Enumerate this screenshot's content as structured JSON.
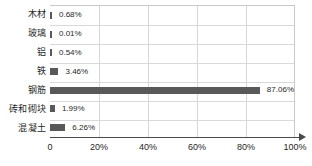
{
  "chart_data": {
    "type": "bar",
    "orientation": "horizontal",
    "title": "",
    "subtitle": "",
    "xlabel": "",
    "ylabel": "",
    "xlim": [
      0,
      100
    ],
    "grid": true,
    "legend": false,
    "legend_position": "none",
    "categories": [
      "木材",
      "玻璃",
      "铝",
      "铁",
      "钢筋",
      "砖和砌块",
      "混凝土"
    ],
    "values": [
      0.68,
      0.01,
      0.54,
      3.46,
      87.06,
      1.99,
      6.26
    ],
    "data_labels": [
      "0.68%",
      "0.01%",
      "0.54%",
      "3.46%",
      "87.06%",
      "1.99%",
      "6.26%"
    ],
    "xticks": [
      0,
      20,
      40,
      60,
      80,
      100
    ],
    "xtick_labels": [
      "0",
      "20%",
      "40%",
      "60%",
      "80%",
      "100%"
    ],
    "bar_color": "#595959",
    "grid_color": "#d7d7d7",
    "axis_color": "#4a4a4a"
  }
}
